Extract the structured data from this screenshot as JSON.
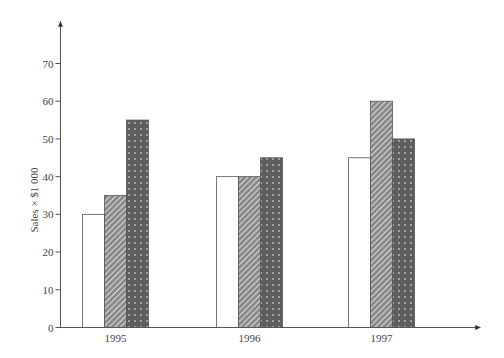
{
  "chart_data": {
    "type": "bar",
    "title": "",
    "xlabel": "",
    "ylabel": "Sales × $1 000",
    "categories": [
      "1995",
      "1996",
      "1997"
    ],
    "series": [
      {
        "name": "Series 1",
        "pattern": "plain-white",
        "values": [
          30,
          40,
          45
        ]
      },
      {
        "name": "Series 2",
        "pattern": "diagonal-hatch",
        "values": [
          35,
          40,
          60
        ]
      },
      {
        "name": "Series 3",
        "pattern": "dotted-dark",
        "values": [
          55,
          45,
          50
        ]
      }
    ],
    "ylim": [
      0,
      70
    ],
    "yticks": [
      0,
      10,
      20,
      30,
      40,
      50,
      60,
      70
    ],
    "grid": false,
    "legend": "none"
  },
  "colors": {
    "axis": "#555555",
    "bar_outline": "#555555",
    "white_fill": "#ffffff",
    "hatch_bg": "#8a8a8a",
    "hatch_line": "#ffffff",
    "dotted_fill": "#5e5e5e",
    "dot": "#b8b8b8"
  }
}
